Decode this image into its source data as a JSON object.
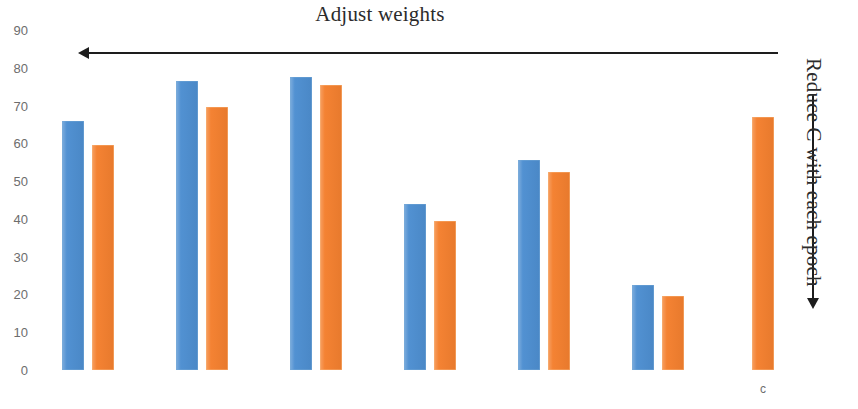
{
  "chart_data": {
    "type": "bar",
    "title": "Adjust weights",
    "xlabel": "",
    "ylabel": "",
    "ylim": [
      0,
      90
    ],
    "grid": false,
    "legend_position": "none",
    "y_ticks": [
      90,
      80,
      70,
      60,
      50,
      40,
      30,
      20,
      10,
      0
    ],
    "categories": [
      "1",
      "2",
      "3",
      "4",
      "5",
      "6",
      "7"
    ],
    "visible_category_labels": [
      "",
      "",
      "",
      "",
      "",
      "",
      "c"
    ],
    "series": [
      {
        "name": "blue",
        "color": "#4e8fd1",
        "values": [
          66,
          76.5,
          77.5,
          44,
          55.5,
          22.5,
          null
        ]
      },
      {
        "name": "orange",
        "color": "#f4802f",
        "values": [
          59.5,
          69.5,
          75.5,
          39.5,
          52.5,
          19.5,
          67
        ]
      }
    ],
    "annotations": [
      {
        "name": "adjust-weights",
        "text": "Adjust weights",
        "arrow_direction": "left",
        "orientation": "horizontal"
      },
      {
        "name": "reduce-c",
        "text": "Reduce C with each epoch",
        "arrow_direction": "down",
        "orientation": "vertical"
      }
    ]
  },
  "layout": {
    "baseline_y": 370,
    "top_value_y": 30,
    "px_per_unit": 3.7778,
    "bar_width": 22,
    "bar_slots_x": [
      62,
      92,
      176,
      206,
      290,
      320,
      404,
      434,
      518,
      548,
      632,
      662,
      752
    ],
    "last_label_x": 763,
    "last_label_y": 382
  },
  "colors": {
    "blue": "#4e8fd1",
    "orange": "#f4802f",
    "tick_text": "#6d6d6d",
    "title_text": "#2b2b2b",
    "arrow": "#1d1d1d",
    "background": "#ffffff"
  }
}
